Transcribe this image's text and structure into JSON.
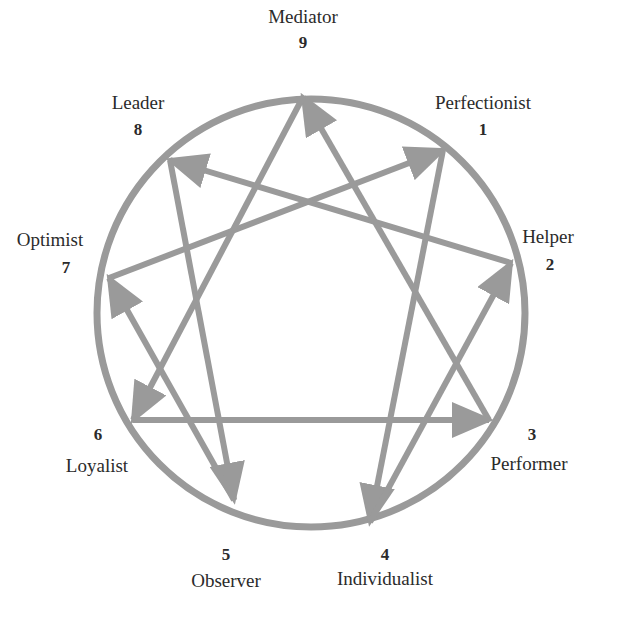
{
  "diagram": {
    "colors": {
      "stroke": "#9a9a9a",
      "text": "#2b2b2b",
      "background": "#ffffff"
    },
    "circle": {
      "cx": 311,
      "cy": 313,
      "r": 214
    },
    "nodes": [
      {
        "num": "9",
        "name": "Mediator",
        "x": 303,
        "y": 97
      },
      {
        "num": "1",
        "name": "Perfectionist",
        "x": 443,
        "y": 150
      },
      {
        "num": "2",
        "name": "Helper",
        "x": 511,
        "y": 263
      },
      {
        "num": "3",
        "name": "Performer",
        "x": 489,
        "y": 420
      },
      {
        "num": "4",
        "name": "Individualist",
        "x": 370,
        "y": 522
      },
      {
        "num": "5",
        "name": "Observer",
        "x": 234,
        "y": 500
      },
      {
        "num": "6",
        "name": "Loyalist",
        "x": 133,
        "y": 420
      },
      {
        "num": "7",
        "name": "Optimist",
        "x": 109,
        "y": 278
      },
      {
        "num": "8",
        "name": "Leader",
        "x": 170,
        "y": 160
      }
    ],
    "arrows": [
      {
        "from": "7",
        "to": "1"
      },
      {
        "from": "1",
        "to": "4"
      },
      {
        "from": "4",
        "to": "2"
      },
      {
        "from": "2",
        "to": "8"
      },
      {
        "from": "8",
        "to": "5"
      },
      {
        "from": "5",
        "to": "7"
      },
      {
        "from": "3",
        "to": "9"
      },
      {
        "from": "9",
        "to": "6"
      },
      {
        "from": "6",
        "to": "3"
      }
    ],
    "labels": {
      "9": {
        "name": "Mediator",
        "num": "9",
        "name_x": 303,
        "name_y": 23,
        "num_x": 303,
        "num_y": 48
      },
      "1": {
        "name": "Perfectionist",
        "num": "1",
        "name_x": 483,
        "name_y": 109,
        "num_x": 483,
        "num_y": 135
      },
      "8": {
        "name": "Leader",
        "num": "8",
        "name_x": 138,
        "name_y": 109,
        "num_x": 138,
        "num_y": 135
      },
      "7": {
        "name": "Optimist",
        "num": "7",
        "name_x": 50,
        "name_y": 246,
        "num_x": 66,
        "num_y": 273
      },
      "2": {
        "name": "Helper",
        "num": "2",
        "name_x": 548,
        "name_y": 243,
        "num_x": 550,
        "num_y": 270
      },
      "6": {
        "name": "Loyalist",
        "num": "6",
        "name_x": 97,
        "name_y": 472,
        "num_x": 98,
        "num_y": 440
      },
      "3": {
        "name": "Performer",
        "num": "3",
        "name_x": 529,
        "name_y": 470,
        "num_x": 532,
        "num_y": 440
      },
      "5": {
        "name": "Observer",
        "num": "5",
        "name_x": 226,
        "name_y": 587,
        "num_x": 226,
        "num_y": 560
      },
      "4": {
        "name": "Individualist",
        "num": "4",
        "name_x": 385,
        "name_y": 585,
        "num_x": 385,
        "num_y": 560
      }
    }
  }
}
